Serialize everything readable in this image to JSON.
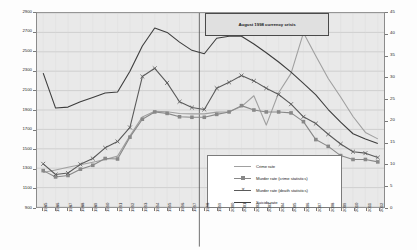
{
  "chart_data": {
    "type": "line",
    "title": "",
    "subtitle": "",
    "xlabel": "",
    "ylabel": "",
    "y2label": "",
    "grid": true,
    "legend_position": "bottom-right",
    "x": [
      1985,
      1986,
      1987,
      1988,
      1989,
      1990,
      1991,
      1992,
      1993,
      1994,
      1995,
      1996,
      1997,
      1998,
      1999,
      2000,
      2001,
      2002,
      2003,
      2004,
      2005,
      2006,
      2007,
      2008,
      2009,
      2010,
      2011,
      2012
    ],
    "categories": [
      "1985",
      "1986",
      "1987",
      "1988",
      "1989",
      "1990",
      "1991",
      "1992",
      "1993",
      "1994",
      "1995",
      "1996",
      "1997",
      "1998",
      "1999",
      "2000",
      "2001",
      "2002",
      "2003",
      "2004",
      "2005",
      "2006",
      "2007",
      "2008",
      "2009",
      "2010",
      "2011",
      "2012"
    ],
    "ylim": [
      900,
      2900
    ],
    "yticks": [
      900,
      1100,
      1300,
      1500,
      1700,
      1900,
      2100,
      2300,
      2500,
      2700,
      2900
    ],
    "y2lim": [
      0,
      45
    ],
    "y2ticks": [
      0,
      5,
      10,
      15,
      20,
      25,
      30,
      35,
      40,
      45
    ],
    "annotations": [
      {
        "text": "August 1998 currency crisis",
        "x": 1997.6,
        "type": "vertical-line-with-box"
      }
    ],
    "series": [
      {
        "name": "Crime rate",
        "axis": "right",
        "color": "#a0a0a0",
        "marker": "none",
        "values": [
          8.0,
          8.6,
          9.2,
          9.8,
          10.4,
          11.0,
          11.8,
          16.5,
          20.9,
          22.2,
          22.1,
          21.7,
          21.6,
          21.6,
          22.0,
          22.1,
          23.3,
          25.8,
          19.0,
          26.5,
          31.0,
          40.4,
          35.0,
          29.8,
          25.5,
          21.0,
          17.3,
          15.8
        ]
      },
      {
        "name": "Murder rate (crime statistics)",
        "axis": "left",
        "color": "#888888",
        "marker": "square",
        "values": [
          1275,
          1210,
          1225,
          1290,
          1330,
          1400,
          1395,
          1620,
          1805,
          1880,
          1865,
          1830,
          1825,
          1825,
          1855,
          1880,
          1945,
          1900,
          1880,
          1880,
          1870,
          1780,
          1595,
          1525,
          1430,
          1390,
          1390,
          1365
        ]
      },
      {
        "name": "Murder rate (death statistics)",
        "axis": "left",
        "color": "#5a5a5a",
        "marker": "x",
        "values": [
          1345,
          1235,
          1250,
          1340,
          1400,
          1510,
          1575,
          1720,
          2245,
          2330,
          2180,
          1985,
          1925,
          1905,
          2125,
          2185,
          2255,
          2200,
          2125,
          2060,
          1960,
          1830,
          1760,
          1650,
          1550,
          1470,
          1455,
          1410
        ]
      },
      {
        "name": "Suicide rate",
        "axis": "left",
        "color": "#3d3d3d",
        "marker": "none",
        "values": [
          2280,
          1920,
          1930,
          1985,
          2030,
          2075,
          2085,
          2300,
          2560,
          2745,
          2700,
          2600,
          2515,
          2480,
          2640,
          2660,
          2660,
          2580,
          2490,
          2395,
          2290,
          2175,
          2055,
          1905,
          1775,
          1655,
          1600,
          1555
        ]
      }
    ]
  },
  "annotation": {
    "label": "August 1998 currency crisis"
  },
  "legend": {
    "items": [
      {
        "label": "Crime rate"
      },
      {
        "label": "Murder rate (crime statistics)"
      },
      {
        "label": "Murder rate (death statistics)"
      },
      {
        "label": "Suicide rate"
      }
    ]
  },
  "axes": {
    "left_ticks": [
      "2900",
      "2700",
      "2500",
      "2300",
      "2100",
      "1900",
      "1700",
      "1500",
      "1300",
      "1100",
      "900"
    ],
    "right_ticks": [
      "45",
      "40",
      "35",
      "30",
      "25",
      "20",
      "15",
      "10",
      "5",
      "0"
    ],
    "x_ticks": [
      "1985",
      "1986",
      "1987",
      "1988",
      "1989",
      "1990",
      "1991",
      "1992",
      "1993",
      "1994",
      "1995",
      "1996",
      "1997",
      "1998",
      "1999",
      "2000",
      "2001",
      "2002",
      "2003",
      "2004",
      "2005",
      "2006",
      "2007",
      "2008",
      "2009",
      "2010",
      "2011",
      "2012"
    ]
  },
  "colors": {
    "plot_background": "#e9e9e9",
    "grid": "#b5b5b5",
    "crime_rate": "#a0a0a0",
    "murder_crime": "#888888",
    "murder_death": "#5a5a5a",
    "suicide": "#3d3d3d"
  }
}
